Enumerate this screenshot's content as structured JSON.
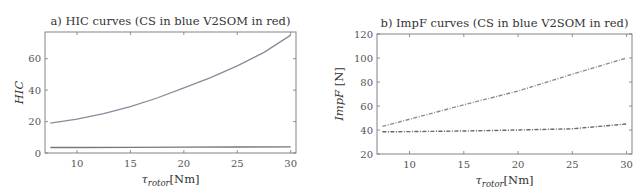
{
  "chart_data": [
    {
      "type": "line",
      "title": "a) HIC curves (CS in blue V2SOM in red)",
      "xlabel": "τrotor[Nm]",
      "xlabel_main": "τ",
      "xlabel_sub": "rotor",
      "xlabel_unit": "[Nm]",
      "ylabel": "HIC",
      "xlim": [
        7,
        30.5
      ],
      "ylim": [
        0,
        77
      ],
      "xticks": [
        10,
        15,
        20,
        25,
        30
      ],
      "xtick_labels": [
        "10",
        "15",
        "20",
        "25",
        "30"
      ],
      "yticks": [
        0,
        20,
        40,
        60
      ],
      "ytick_labels": [
        "0",
        "20",
        "40",
        "60"
      ],
      "grid": false,
      "legend": null,
      "series": [
        {
          "name": "CS (blue)",
          "style": "solid",
          "color": "#8a8a9a",
          "x": [
            7.5,
            10,
            12.5,
            15,
            17.5,
            20,
            22.5,
            25,
            27.5,
            30
          ],
          "y": [
            19,
            21.5,
            25,
            29.5,
            35,
            41.5,
            48,
            55.5,
            64,
            75
          ]
        },
        {
          "name": "V2SOM (red)",
          "style": "solid",
          "color": "#777777",
          "x": [
            7.5,
            10,
            15,
            20,
            25,
            30
          ],
          "y": [
            3.5,
            3.5,
            3.6,
            3.7,
            3.8,
            3.9
          ]
        }
      ]
    },
    {
      "type": "line",
      "title": "b) ImpF curves (CS in blue V2SOM in red)",
      "xlabel": "τrotor[Nm]",
      "xlabel_main": "τ",
      "xlabel_sub": "rotor",
      "xlabel_unit": "[Nm]",
      "ylabel": "ImpF [N]",
      "ylabel_main": "ImpF",
      "ylabel_unit": " [N]",
      "xlim": [
        7,
        30.5
      ],
      "ylim": [
        20,
        120
      ],
      "xticks": [
        10,
        15,
        20,
        25,
        30
      ],
      "xtick_labels": [
        "10",
        "15",
        "20",
        "25",
        "30"
      ],
      "yticks": [
        20,
        40,
        60,
        80,
        100,
        120
      ],
      "ytick_labels": [
        "20",
        "40",
        "60",
        "80",
        "100",
        "120"
      ],
      "grid": false,
      "legend": null,
      "series": [
        {
          "name": "CS (blue)",
          "style": "dash-dot",
          "color": "#8a8a9a",
          "x": [
            7.5,
            10,
            15,
            20,
            25,
            30
          ],
          "y": [
            43,
            49,
            61,
            72.5,
            86.5,
            100
          ]
        },
        {
          "name": "V2SOM (red)",
          "style": "dash-dot",
          "color": "#666666",
          "x": [
            7.5,
            10,
            15,
            20,
            25,
            27.5,
            30
          ],
          "y": [
            38.5,
            38.7,
            39.2,
            40,
            41,
            43,
            45
          ]
        }
      ]
    }
  ]
}
